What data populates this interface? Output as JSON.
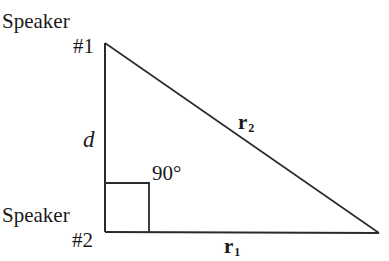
{
  "diagram": {
    "type": "right-triangle",
    "speaker1": {
      "label": "Speaker",
      "number": "#1"
    },
    "speaker2": {
      "label": "Speaker",
      "number": "#2"
    },
    "vertical_side_label": "d",
    "right_angle_label": "90°",
    "hypotenuse_label": {
      "base": "r",
      "subscript": "2"
    },
    "bottom_side_label": {
      "base": "r",
      "subscript": "1"
    },
    "vertices": {
      "top": [
        105,
        43
      ],
      "bottom_left": [
        105,
        232
      ],
      "bottom_right": [
        379,
        233
      ]
    },
    "right_angle_box": {
      "x": 105,
      "y": 183,
      "width": 44,
      "height": 49
    },
    "line_color": "#2a2a2a"
  }
}
